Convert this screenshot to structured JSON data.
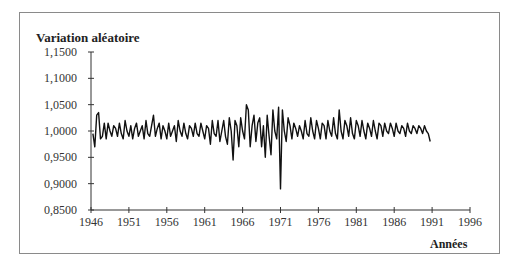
{
  "chart_data": {
    "type": "line",
    "title": "",
    "ylabel": "Variation aléatoire",
    "xlabel": "Années",
    "ylim": [
      0.85,
      1.15
    ],
    "xlim": [
      1946,
      1996
    ],
    "grid": false,
    "legend": null,
    "y_ticks": [
      "1,1500",
      "1,1000",
      "1,0500",
      "1,0000",
      "0,9500",
      "0,9000",
      "0,8500"
    ],
    "y_tick_values": [
      1.15,
      1.1,
      1.05,
      1.0,
      0.95,
      0.9,
      0.85
    ],
    "x_ticks": [
      "1946",
      "1951",
      "1956",
      "1961",
      "1966",
      "1971",
      "1976",
      "1981",
      "1986",
      "1991",
      "1996"
    ],
    "x_tick_values": [
      1946,
      1951,
      1956,
      1961,
      1966,
      1971,
      1976,
      1981,
      1986,
      1991,
      1996
    ],
    "series": [
      {
        "name": "Variation aléatoire",
        "x_start": 1946.25,
        "x_step": 0.25,
        "values": [
          0.995,
          0.97,
          1.03,
          1.035,
          0.985,
          0.99,
          1.015,
          0.985,
          1.015,
          1.0,
          0.99,
          1.01,
          1.005,
          0.99,
          1.015,
          0.995,
          0.985,
          1.02,
          1.0,
          0.99,
          1.01,
          0.985,
          1.005,
          1.015,
          0.99,
          1.0,
          1.01,
          0.985,
          1.02,
          0.995,
          0.99,
          1.01,
          1.03,
          0.99,
          1.005,
          1.015,
          0.985,
          1.01,
          1.0,
          0.985,
          1.015,
          0.99,
          1.0,
          1.01,
          0.98,
          1.02,
          1.0,
          0.99,
          1.015,
          0.995,
          0.985,
          1.01,
          1.005,
          0.99,
          1.015,
          0.995,
          0.99,
          1.015,
          1.0,
          0.985,
          1.01,
          1.005,
          0.975,
          1.02,
          0.995,
          0.99,
          1.02,
          0.98,
          1.0,
          1.02,
          0.99,
          0.975,
          1.025,
          1.0,
          0.945,
          1.02,
          1.01,
          0.97,
          1.025,
          1.0,
          0.985,
          1.05,
          1.04,
          0.97,
          1.01,
          1.03,
          0.98,
          1.015,
          1.025,
          0.97,
          1.01,
          0.95,
          1.03,
          0.99,
          0.955,
          1.04,
          1.0,
          0.985,
          1.045,
          0.89,
          1.04,
          1.0,
          0.98,
          1.025,
          1.01,
          0.985,
          1.015,
          1.005,
          0.99,
          1.01,
          1.0,
          0.985,
          1.02,
          0.995,
          0.99,
          1.025,
          1.0,
          0.985,
          1.02,
          1.005,
          0.985,
          1.015,
          1.01,
          0.985,
          1.02,
          1.0,
          0.99,
          1.025,
          0.995,
          0.985,
          1.04,
          1.0,
          0.985,
          1.02,
          1.01,
          0.99,
          1.025,
          0.995,
          0.985,
          1.02,
          1.01,
          0.99,
          1.02,
          1.0,
          0.985,
          1.015,
          1.005,
          0.99,
          1.02,
          1.0,
          0.985,
          1.015,
          1.01,
          0.99,
          1.015,
          1.0,
          0.995,
          1.015,
          1.005,
          0.99,
          1.015,
          1.0,
          0.995,
          1.01,
          1.005,
          0.99,
          1.015,
          1.0,
          0.995,
          1.01,
          1.005,
          0.995,
          1.01,
          1.005,
          0.995,
          1.01,
          1.0,
          0.995,
          0.98
        ]
      }
    ]
  },
  "chart": {
    "y_axis_title": "Variation aléatoire",
    "x_axis_title": "Années",
    "line_color": "#111111",
    "axis_color": "#333333",
    "frame_color": "#8a8a8a"
  }
}
